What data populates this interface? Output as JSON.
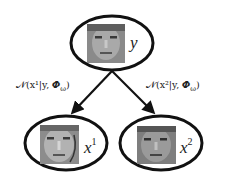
{
  "diagram": {
    "type": "graphical-model",
    "nodes": [
      {
        "id": "y",
        "label": "y",
        "label_sup": "",
        "content": "face-image"
      },
      {
        "id": "x1",
        "label": "x",
        "label_sup": "1",
        "content": "face-image"
      },
      {
        "id": "x2",
        "label": "x",
        "label_sup": "2",
        "content": "face-image"
      }
    ],
    "edges": [
      {
        "from": "y",
        "to": "x1",
        "label": "𝒩(x¹|y, Φ_ω)",
        "label_display": "𝒩(x¹|y, 𝜱ω)"
      },
      {
        "from": "y",
        "to": "x2",
        "label": "𝒩(x²|y, Φ_ω)",
        "label_display": "𝒩(x²|y, 𝜱ω)"
      }
    ]
  },
  "labels": {
    "y": "y",
    "x1_base": "x",
    "x1_sup": "1",
    "x2_base": "x",
    "x2_sup": "2",
    "edge1": "𝒩(x¹|y, 𝜱",
    "edge1_sub": "ω",
    "edge1_close": ")",
    "edge2": "𝒩(x²|y, 𝜱",
    "edge2_sub": "ω",
    "edge2_close": ")"
  },
  "colors": {
    "stroke": "#111111",
    "text": "#222222",
    "background": "#ffffff"
  }
}
